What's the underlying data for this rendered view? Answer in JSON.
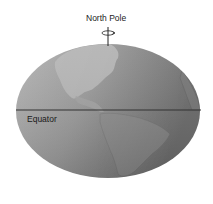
{
  "diagram": {
    "north_pole_label": "North Pole",
    "equator_label": "Equator",
    "colors": {
      "globe_light": "#bdbdbd",
      "globe_dark": "#6e6e6e",
      "land": "#a9a9a9",
      "equator_line": "#333333",
      "axis": "#222222"
    }
  }
}
